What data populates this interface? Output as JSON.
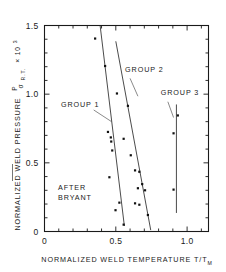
{
  "figure": {
    "caption_note": "AFTER BRYANT",
    "note_line1": "AFTER",
    "note_line2": "BRYANT"
  },
  "chart_data": {
    "type": "scatter",
    "title": "",
    "subtitle": "",
    "xlabel": "NORMALIZED WELD TEMPERATURE   T/T",
    "xlabel_sub": "M",
    "ylabel": "NORMALIZED WELD PRESSURE",
    "ylabel_frac_num": "P",
    "ylabel_frac_den": "σ",
    "ylabel_den_sub": "R.T.",
    "ylabel_mult": "× 10",
    "ylabel_exp": "3",
    "xlim": [
      0,
      1.15
    ],
    "ylim": [
      0,
      1.5
    ],
    "xticks": [
      0,
      0.5,
      1.0
    ],
    "xtick_labels": [
      "0",
      "0.5",
      "1.0"
    ],
    "xminor_step": 0.1,
    "yticks": [
      0,
      0.5,
      1.0,
      1.5
    ],
    "ytick_labels": [
      "0",
      "0.5",
      "1.0",
      "1.5"
    ],
    "yminor_step": 0.1,
    "grid": false,
    "legend_position": "none",
    "series": [
      {
        "name": "GROUP 1",
        "label": "GROUP 1",
        "label_x": 0.115,
        "label_y": 0.905,
        "leader": [
          [
            0.345,
            0.885
          ],
          [
            0.47,
            0.8
          ]
        ],
        "trendline": [
          [
            0.39,
            1.5
          ],
          [
            0.56,
            0.04
          ]
        ],
        "points": [
          [
            0.355,
            1.405
          ],
          [
            0.425,
            1.205
          ],
          [
            0.445,
            0.725
          ],
          [
            0.465,
            0.685
          ],
          [
            0.468,
            0.655
          ],
          [
            0.475,
            0.59
          ],
          [
            0.455,
            0.395
          ],
          [
            0.498,
            0.155
          ],
          [
            0.525,
            0.21
          ],
          [
            0.555,
            0.05
          ]
        ]
      },
      {
        "name": "GROUP 2",
        "label": "GROUP 2",
        "label_x": 0.565,
        "label_y": 1.165,
        "leader": [
          [
            0.6,
            1.115
          ],
          [
            0.655,
            0.985
          ]
        ],
        "trendline": [
          [
            0.5,
            1.385
          ],
          [
            0.745,
            0.01
          ]
        ],
        "points": [
          [
            0.508,
            1.005
          ],
          [
            0.585,
            0.915
          ],
          [
            0.555,
            0.675
          ],
          [
            0.605,
            0.555
          ],
          [
            0.635,
            0.445
          ],
          [
            0.665,
            0.435
          ],
          [
            0.685,
            0.345
          ],
          [
            0.655,
            0.315
          ],
          [
            0.705,
            0.3
          ],
          [
            0.635,
            0.205
          ],
          [
            0.665,
            0.195
          ],
          [
            0.725,
            0.12
          ]
        ]
      },
      {
        "name": "GROUP 3",
        "label": "GROUP 3",
        "label_x": 0.815,
        "label_y": 0.995,
        "leader": [
          [
            0.865,
            0.945
          ],
          [
            0.905,
            0.83
          ]
        ],
        "trendline": [
          [
            0.925,
            0.925
          ],
          [
            0.925,
            0.135
          ]
        ],
        "points": [
          [
            0.935,
            0.845
          ],
          [
            0.905,
            0.715
          ],
          [
            0.905,
            0.305
          ]
        ]
      }
    ]
  }
}
